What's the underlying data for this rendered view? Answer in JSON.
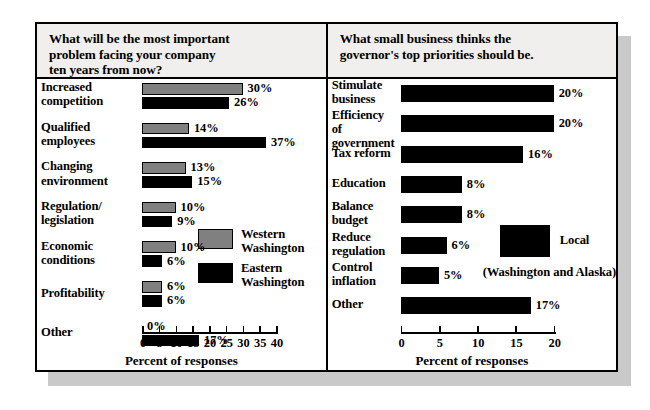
{
  "figure": {
    "axis_title": "Percent of responses",
    "colors": {
      "western": "#808080",
      "eastern": "#000000",
      "local": "#000000",
      "title_bg": "#f0efed",
      "frame": "#000000"
    }
  },
  "left_panel": {
    "title": "What will be the most important problem facing your company ten years from now?",
    "title_lines": [
      "What will be the most important",
      "problem facing your company",
      "ten years from now?"
    ],
    "legend": [
      {
        "label_lines": [
          "Western",
          "Washington"
        ],
        "label": "Western Washington",
        "color": "#808080"
      },
      {
        "label_lines": [
          "Eastern",
          "Washington"
        ],
        "label": "Eastern Washington",
        "color": "#000000"
      }
    ]
  },
  "right_panel": {
    "title": "What small business thinks the governor's top priorities should be.",
    "title_lines": [
      "What small business thinks the",
      "governor's top priorities should be."
    ],
    "legend": [
      {
        "label": "Local",
        "sub": "(Washington and Alaska)",
        "color": "#000000"
      }
    ]
  },
  "chart_data": [
    {
      "type": "bar",
      "orientation": "horizontal",
      "title": "What will be the most important problem facing your company ten years from now?",
      "xlabel": "Percent of responses",
      "ylabel": "",
      "xlim": [
        0,
        40
      ],
      "xticks": [
        0,
        5,
        10,
        15,
        20,
        25,
        30,
        35,
        40
      ],
      "xtick_labels": [
        "0",
        "5",
        "10",
        "15",
        "20",
        "25",
        "30",
        "35",
        "40"
      ],
      "grid": false,
      "legend_position": "inside-right",
      "categories": [
        "Increased competition",
        "Qualified employees",
        "Changing environment",
        "Regulation/ legislation",
        "Economic conditions",
        "Profitability",
        "Other"
      ],
      "category_lines": [
        [
          "Increased",
          "competition"
        ],
        [
          "Qualified",
          "employees"
        ],
        [
          "Changing",
          "environment"
        ],
        [
          "Regulation/",
          "legislation"
        ],
        [
          "Economic",
          "conditions"
        ],
        [
          "Profitability"
        ],
        [
          "Other"
        ]
      ],
      "series": [
        {
          "name": "Western Washington",
          "color": "#808080",
          "values": [
            30,
            14,
            13,
            10,
            10,
            6,
            0
          ],
          "data_labels": [
            "30%",
            "14%",
            "13%",
            "10%",
            "10%",
            "6%",
            "0%"
          ]
        },
        {
          "name": "Eastern Washington",
          "color": "#000000",
          "values": [
            26,
            37,
            15,
            9,
            6,
            6,
            17
          ],
          "data_labels": [
            "26%",
            "37%",
            "15%",
            "9%",
            "6%",
            "6%",
            "17%"
          ]
        }
      ]
    },
    {
      "type": "bar",
      "orientation": "horizontal",
      "title": "What small business thinks the governor's top priorities should be.",
      "xlabel": "Percent of responses",
      "ylabel": "",
      "xlim": [
        0,
        20
      ],
      "xticks": [
        0,
        5,
        10,
        15,
        20
      ],
      "xtick_labels": [
        "0",
        "5",
        "10",
        "15",
        "20"
      ],
      "grid": false,
      "legend_position": "inside-right",
      "categories": [
        "Stimulate business",
        "Efficiency of government",
        "Tax reform",
        "Education",
        "Balance budget",
        "Reduce regulation",
        "Control inflation",
        "Other"
      ],
      "category_lines": [
        [
          "Stimulate",
          "business"
        ],
        [
          "Efficiency of",
          "government"
        ],
        [
          "Tax reform"
        ],
        [
          "Education"
        ],
        [
          "Balance",
          "budget"
        ],
        [
          "Reduce",
          "regulation"
        ],
        [
          "Control",
          "inflation"
        ],
        [
          "Other"
        ]
      ],
      "series": [
        {
          "name": "Local (Washington and Alaska)",
          "color": "#000000",
          "values": [
            20,
            20,
            16,
            8,
            8,
            6,
            5,
            17
          ],
          "data_labels": [
            "20%",
            "20%",
            "16%",
            "8%",
            "8%",
            "6%",
            "5%",
            "17%"
          ]
        }
      ]
    }
  ]
}
